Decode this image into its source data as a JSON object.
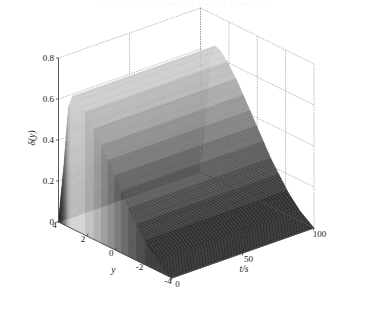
{
  "figure": {
    "top_cut_text": "· · · · ·  · ·· · ·· ·· · · ·· ·· ·· ·· ·· ·",
    "background_color": "#ffffff",
    "line_color": "#4d4d4d",
    "grid_color": "#9a9a9a"
  },
  "chart_data": {
    "type": "area",
    "render_style": "surface3d",
    "title": "",
    "subtitle": "",
    "xlabel": "t/s",
    "ylabel": "y",
    "zlabel": "δ(y)",
    "xlim": [
      0,
      100
    ],
    "ylim": [
      -4,
      4
    ],
    "zlim": [
      0,
      0.8
    ],
    "xticks": [
      0,
      50,
      100
    ],
    "xtick_labels": [
      "0",
      "50",
      "100"
    ],
    "yticks": [
      4,
      2,
      0,
      -2,
      -4
    ],
    "ytick_labels": [
      "4",
      "2",
      "0",
      "-2",
      "-4"
    ],
    "zticks": [
      0,
      0.2,
      0.4,
      0.6,
      0.8
    ],
    "ztick_labels": [
      "0",
      "0.2",
      "0.4",
      "0.6",
      "0.8"
    ],
    "grid": true,
    "legend": null,
    "colormap": "gray",
    "annotations": [],
    "band_levels": [
      0.05,
      0.12,
      0.18,
      0.24,
      0.3,
      0.36,
      0.42,
      0.48,
      0.54,
      0.6,
      0.65
    ],
    "band_colors": [
      "#2b2b2b",
      "#3a3a3a",
      "#4a4a4a",
      "#5c5c5c",
      "#6e6e6e",
      "#828282",
      "#969696",
      "#aaaaaa",
      "#bebebe",
      "#d2d2d2",
      "#e4e4e4"
    ],
    "profile_y": [
      4.0,
      3.6,
      3.3,
      3.0,
      2.6,
      2.2,
      1.8,
      1.4,
      1.0,
      0.6,
      0.2,
      -0.2,
      -0.6,
      -1.0,
      -1.4,
      -1.8,
      -2.2,
      -2.6,
      -3.0,
      -3.4,
      -3.8,
      -4.0
    ],
    "profile_z": [
      0.0,
      0.3,
      0.58,
      0.65,
      0.64,
      0.61,
      0.57,
      0.53,
      0.48,
      0.43,
      0.38,
      0.33,
      0.28,
      0.23,
      0.19,
      0.15,
      0.11,
      0.08,
      0.05,
      0.03,
      0.01,
      0.0
    ]
  }
}
